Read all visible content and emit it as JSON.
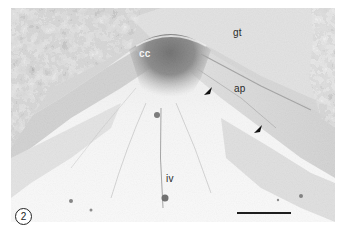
{
  "figure": {
    "panel_number": "2",
    "type": "scanning electron micrograph",
    "labels": {
      "cc": "cc",
      "gt": "gt",
      "ap": "ap",
      "iv": "iv"
    },
    "arrowheads": 2,
    "scale_bar": true
  },
  "colors": {
    "background": "#ffffff",
    "tissue_light": "#eeeeee",
    "tissue_mid": "#9a9a9a",
    "tissue_dark": "#3a3a3a",
    "label_dark": "#2a2a2a",
    "label_light": "#f4f4f4"
  }
}
